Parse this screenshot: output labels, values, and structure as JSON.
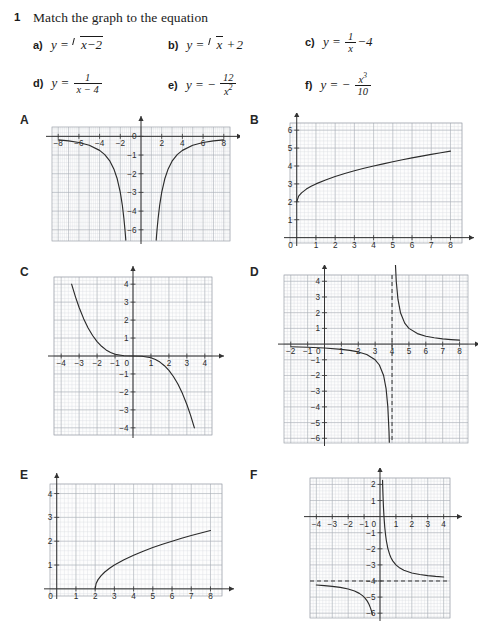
{
  "header": {
    "number": "1",
    "title": "Match the graph to the equation",
    "equations": [
      {
        "label": "a)",
        "latex": "y = √(x − 2)",
        "type": "sqrt-shift",
        "inner": "x − 2",
        "after": ""
      },
      {
        "label": "b)",
        "latex": "y = √x + 2",
        "type": "sqrt-plus",
        "inner": "x",
        "after": " + 2"
      },
      {
        "label": "c)",
        "latex": "y = 1/x − 4",
        "type": "frac-after",
        "num": "1",
        "den": "x",
        "after": " − 4"
      },
      {
        "label": "d)",
        "latex": "y = 1/(x − 4)",
        "type": "frac",
        "num": "1",
        "den": "x − 4",
        "after": ""
      },
      {
        "label": "e)",
        "latex": "y = − 12/x²",
        "type": "neg-frac",
        "num": "12",
        "den": "x²",
        "after": ""
      },
      {
        "label": "f)",
        "latex": "y = − x³/10",
        "type": "neg-frac",
        "num": "x³",
        "den": "10",
        "after": ""
      }
    ]
  },
  "chart_data": [
    {
      "id": "A",
      "letter": "A",
      "type": "line",
      "function": "y = -12/x^2",
      "title": "",
      "xlabel": "",
      "ylabel": "",
      "xlim": [
        -8.6,
        8.6
      ],
      "ylim": [
        -5.6,
        0.5
      ],
      "xticks": [
        -8,
        -6,
        -4,
        -2,
        2,
        4,
        6,
        8
      ],
      "xticklabels": [
        "−8",
        "−6",
        "−4",
        "−2",
        "2",
        "4",
        "6",
        "8"
      ],
      "yticks": [
        0,
        -1,
        -2,
        -3,
        -4,
        -5,
        -6
      ],
      "yticklabels": [
        "0",
        "−1",
        "−2",
        "−3",
        "−4",
        "−6",
        "−5"
      ],
      "grid": true,
      "minor_grid": true,
      "asymptotes": [],
      "series": [
        {
          "name": "left-branch",
          "points": "-8,-0.19 -7,-0.24 -6,-0.33 -5,-0.48 -4,-0.75 -3.5,-0.98 -3,-1.33 -2.6,-1.78 -2.3,-2.27 -2.0,-3.0 -1.8,-3.70 -1.65,-4.41 -1.55,-4.99 -1.50,-5.33 -1.47,-5.55"
        },
        {
          "name": "right-branch",
          "points": "1.47,-5.55 1.50,-5.33 1.55,-4.99 1.65,-4.41 1.8,-3.70 2.0,-3.0 2.3,-2.27 2.6,-1.78 3,-1.33 3.5,-0.98 4,-0.75 5,-0.48 6,-0.33 7,-0.24 8,-0.19"
        }
      ]
    },
    {
      "id": "B",
      "letter": "B",
      "type": "line",
      "function": "y = sqrt(x) + 2",
      "title": "",
      "xlabel": "",
      "ylabel": "",
      "xlim": [
        -0.35,
        8.6
      ],
      "ylim": [
        -0.3,
        6.4
      ],
      "xticks": [
        1,
        2,
        3,
        4,
        5,
        6,
        7,
        8
      ],
      "xticklabels": [
        "1",
        "2",
        "3",
        "4",
        "5",
        "6",
        "7",
        "8"
      ],
      "yticks": [
        1,
        2,
        3,
        4,
        5,
        6
      ],
      "yticklabels": [
        "1",
        "2",
        "3",
        "4",
        "5",
        "6"
      ],
      "origin_label": "0",
      "grid": true,
      "minor_grid": true,
      "asymptotes": [],
      "series": [
        {
          "name": "sqrt-curve",
          "points": "0,2 0.1,2.32 0.25,2.50 0.5,2.71 0.75,2.87 1,3.00 1.5,3.22 2,3.41 2.5,3.58 3,3.73 3.5,3.87 4,4.00 4.5,4.12 5,4.24 5.5,4.35 6,4.45 6.5,4.55 7,4.65 7.5,4.74 8,4.83"
        }
      ]
    },
    {
      "id": "C",
      "letter": "C",
      "type": "line",
      "function": "y = -x^3/10",
      "title": "",
      "xlabel": "",
      "ylabel": "",
      "xlim": [
        -4.4,
        4.4
      ],
      "ylim": [
        -4.4,
        4.4
      ],
      "xticks": [
        -4,
        -3,
        -2,
        -1,
        1,
        2,
        3,
        4
      ],
      "xticklabels": [
        "−4",
        "−3",
        "−2",
        "−1",
        "1",
        "2",
        "3",
        "4"
      ],
      "yticks": [
        -4,
        -3,
        -2,
        -1,
        1,
        2,
        3,
        4
      ],
      "yticklabels": [
        "−4",
        "−3",
        "−2",
        "−1",
        "1",
        "2",
        "3",
        "4"
      ],
      "origin_label": "0",
      "grid": true,
      "minor_grid": true,
      "asymptotes": [],
      "series": [
        {
          "name": "cubic",
          "points": "-3.42,4.0 -3.2,3.28 -3.0,2.70 -2.75,2.08 -2.5,1.56 -2.25,1.14 -2.0,0.80 -1.75,0.54 -1.5,0.34 -1.25,0.20 -1.0,0.10 -0.5,0.0125 0,0 0.5,-0.0125 1.0,-0.10 1.25,-0.20 1.5,-0.34 1.75,-0.54 2.0,-0.80 2.25,-1.14 2.5,-1.56 2.75,-2.08 3.0,-2.70 3.2,-3.28 3.42,-4.0"
        }
      ]
    },
    {
      "id": "D",
      "letter": "D",
      "type": "line",
      "function": "y = 1/(x - 4)",
      "title": "",
      "xlabel": "",
      "ylabel": "",
      "xlim": [
        -2.4,
        8.5
      ],
      "ylim": [
        -6.3,
        4.4
      ],
      "xticks": [
        -2,
        -1,
        1,
        2,
        3,
        4,
        5,
        6,
        7,
        8
      ],
      "xticklabels": [
        "−2",
        "−1",
        "1",
        "2",
        "3",
        "4",
        "5",
        "6",
        "7",
        "8"
      ],
      "yticks": [
        -6,
        -5,
        -4,
        -3,
        -2,
        -1,
        1,
        2,
        3,
        4
      ],
      "yticklabels": [
        "−6",
        "−5",
        "−4",
        "−3",
        "−2",
        "−1",
        "1",
        "2",
        "3",
        "4"
      ],
      "origin_label": "0",
      "grid": true,
      "minor_grid": true,
      "asymptotes": [
        {
          "orientation": "vertical",
          "value": 4,
          "style": "dashed"
        }
      ],
      "series": [
        {
          "name": "left-branch",
          "points": "-2,-0.167 -1,-0.20 0,-0.25 1,-0.333 1.5,-0.40 2,-0.50 2.5,-0.667 3,-1.0 3.25,-1.333 3.5,-2.0 3.65,-2.857 3.75,-4.0 3.82,-5.55 3.84,-6.25"
        },
        {
          "name": "right-branch",
          "points": "4.16,6.25 4.18,5.55 4.25,4.0 4.35,2.857 4.5,2.0 4.75,1.333 5,1.0 5.5,0.667 6,0.50 6.5,0.40 7,0.333 7.5,0.286 8,0.25"
        }
      ]
    },
    {
      "id": "E",
      "letter": "E",
      "type": "line",
      "function": "y = sqrt(x - 2)",
      "title": "",
      "xlabel": "",
      "ylabel": "",
      "xlim": [
        -0.35,
        8.6
      ],
      "ylim": [
        -0.3,
        4.4
      ],
      "xticks": [
        1,
        2,
        3,
        4,
        5,
        6,
        7,
        8
      ],
      "xticklabels": [
        "1",
        "2",
        "3",
        "4",
        "5",
        "6",
        "7",
        "8"
      ],
      "yticks": [
        1,
        2,
        3,
        4
      ],
      "yticklabels": [
        "1",
        "2",
        "3",
        "4"
      ],
      "origin_label": "0",
      "grid": true,
      "minor_grid": true,
      "asymptotes": [],
      "series": [
        {
          "name": "sqrt-shift-curve",
          "points": "2,0 2.05,0.224 2.15,0.387 2.3,0.548 2.5,0.707 2.75,0.866 3,1.0 3.5,1.225 4,1.414 4.5,1.581 5,1.732 5.5,1.871 6,2.0 6.5,2.121 7,2.236 7.5,2.345 8,2.449"
        }
      ]
    },
    {
      "id": "F",
      "letter": "F",
      "type": "line",
      "function": "y = 1/x - 4",
      "title": "",
      "xlabel": "",
      "ylabel": "",
      "xlim": [
        -4.4,
        4.4
      ],
      "ylim": [
        -6.3,
        2.4
      ],
      "xticks": [
        -4,
        -3,
        -2,
        -1,
        1,
        2,
        3,
        4
      ],
      "xticklabels": [
        "−4",
        "−3",
        "−2",
        "−1",
        "1",
        "2",
        "3",
        "4"
      ],
      "yticks": [
        -6,
        -5,
        -4,
        -3,
        -2,
        -1,
        1,
        2
      ],
      "yticklabels": [
        "−6",
        "−5",
        "−4",
        "−3",
        "−2",
        "−1",
        "1",
        "2"
      ],
      "origin_label": "0",
      "grid": true,
      "minor_grid": true,
      "asymptotes": [
        {
          "orientation": "horizontal",
          "value": -4,
          "style": "dashed"
        }
      ],
      "series": [
        {
          "name": "left-branch",
          "points": "-4,-4.25 -3.5,-4.286 -3,-4.333 -2.5,-4.40 -2,-4.50 -1.6,-4.625 -1.3,-4.77 -1.1,-4.91 -0.95,-5.05 -0.8,-5.25 -0.7,-5.43 -0.6,-5.67 -0.52,-5.92 -0.48,-6.08"
        },
        {
          "name": "right-branch",
          "points": "0.16,2.25 0.17,1.88 0.18,1.56 0.2,1.0 0.22,0.545 0.25,0.0 0.3,-0.667 0.35,-1.143 0.4,-1.5 0.5,-2.0 0.6,-2.333 0.7,-2.571 0.8,-2.75 1,-3.0 1.25,-3.2 1.5,-3.333 2,-3.5 2.5,-3.6 3,-3.667 3.5,-3.714 4,-3.75"
        }
      ]
    }
  ],
  "panels": {
    "A": {
      "x": 20,
      "y": 113,
      "w": 220,
      "h": 135
    },
    "B": {
      "x": 250,
      "y": 113,
      "w": 225,
      "h": 140
    },
    "C": {
      "x": 20,
      "y": 265,
      "w": 220,
      "h": 175
    },
    "D": {
      "x": 250,
      "y": 265,
      "w": 228,
      "h": 185
    },
    "E": {
      "x": 20,
      "y": 468,
      "w": 220,
      "h": 150
    },
    "F": {
      "x": 250,
      "y": 468,
      "w": 228,
      "h": 160
    }
  }
}
